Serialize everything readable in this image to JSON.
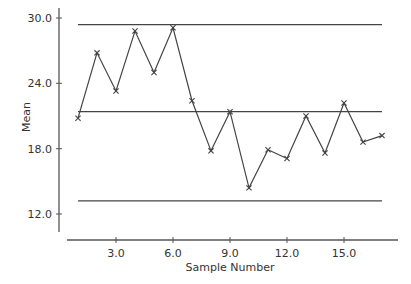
{
  "chart_data": {
    "type": "line",
    "title": "",
    "xlabel": "Sample Number",
    "ylabel": "Mean",
    "x": [
      1,
      2,
      3,
      4,
      5,
      6,
      7,
      8,
      9,
      10,
      11,
      12,
      13,
      14,
      15,
      16,
      17
    ],
    "series": [
      {
        "name": "Sample Mean",
        "marker": "x",
        "values": [
          20.8,
          26.8,
          23.3,
          28.8,
          25.0,
          29.1,
          22.4,
          17.8,
          21.4,
          14.4,
          17.9,
          17.1,
          21.0,
          17.6,
          22.2,
          18.6,
          19.2
        ]
      }
    ],
    "reference_lines": [
      {
        "name": "UCL",
        "value": 29.4
      },
      {
        "name": "Center Line",
        "value": 21.4
      },
      {
        "name": "LCL",
        "value": 13.2
      }
    ],
    "xticks": [
      3.0,
      6.0,
      9.0,
      12.0,
      15.0
    ],
    "xtick_labels": [
      "3.0",
      "6.0",
      "9.0",
      "12.0",
      "15.0"
    ],
    "yticks": [
      12.0,
      18.0,
      24.0,
      30.0
    ],
    "ytick_labels": [
      "12.0",
      "18.0",
      "24.0",
      "30.0"
    ],
    "xlim": [
      0.5,
      18.5
    ],
    "ylim": [
      10.4,
      31.0
    ],
    "grid": false,
    "legend": null
  },
  "colors": {
    "line": "#444444",
    "axis": "#555555",
    "text": "#333333"
  }
}
